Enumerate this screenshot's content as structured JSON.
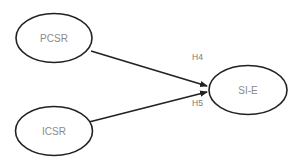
{
  "diagram": {
    "type": "path-model",
    "nodes": [
      {
        "id": "pcsr",
        "label": "PCSR"
      },
      {
        "id": "icsr",
        "label": "ICSR"
      },
      {
        "id": "sie",
        "label": "SI-E"
      }
    ],
    "edges": [
      {
        "from": "pcsr",
        "to": "sie",
        "label": "H4"
      },
      {
        "from": "icsr",
        "to": "sie",
        "label": "H5"
      }
    ],
    "colors": {
      "stroke": "#222222",
      "text": "#8a8a8a",
      "background": "#ffffff"
    }
  }
}
